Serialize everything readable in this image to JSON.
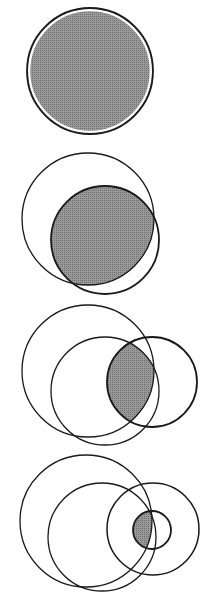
{
  "diagram": {
    "type": "nested-set-intersection-sequence",
    "colors": {
      "background": "#ffffff",
      "stroke": "#1a1a1a",
      "shade": "#8a8a8a"
    },
    "panels": [
      {
        "id": "panel-1",
        "circles": [
          {
            "name": "A",
            "cx": 90,
            "cy": 71,
            "r": 63,
            "stroke_width": 1.8
          }
        ],
        "shaded": [
          "A"
        ]
      },
      {
        "id": "panel-2",
        "circles": [
          {
            "name": "A",
            "cx": 88,
            "cy": 219,
            "r": 66,
            "stroke_width": 1.3
          },
          {
            "name": "B",
            "cx": 105,
            "cy": 240,
            "r": 54,
            "stroke_width": 1.8
          }
        ],
        "shaded": [
          "A",
          "B"
        ]
      },
      {
        "id": "panel-3",
        "circles": [
          {
            "name": "A",
            "cx": 88,
            "cy": 371,
            "r": 66,
            "stroke_width": 1.3
          },
          {
            "name": "B",
            "cx": 105,
            "cy": 391,
            "r": 54,
            "stroke_width": 1.3
          },
          {
            "name": "C",
            "cx": 152,
            "cy": 382,
            "r": 45,
            "stroke_width": 1.8
          }
        ],
        "shaded": [
          "A",
          "B",
          "C"
        ]
      },
      {
        "id": "panel-4",
        "circles": [
          {
            "name": "A",
            "cx": 86,
            "cy": 521,
            "r": 66,
            "stroke_width": 1.3
          },
          {
            "name": "B",
            "cx": 102,
            "cy": 537,
            "r": 54,
            "stroke_width": 1.3
          },
          {
            "name": "C",
            "cx": 153,
            "cy": 529,
            "r": 46,
            "stroke_width": 1.5
          },
          {
            "name": "D",
            "cx": 152,
            "cy": 530,
            "r": 19,
            "stroke_width": 1.8
          }
        ],
        "shaded": [
          "A",
          "B",
          "C",
          "D"
        ]
      }
    ]
  }
}
